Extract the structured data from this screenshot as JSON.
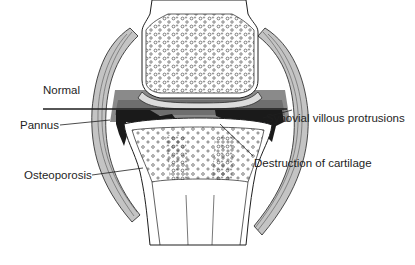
{
  "diagram": {
    "labels": {
      "normal": "Normal",
      "pannus": "Pannus",
      "synovial": "Synovial villous protrusions",
      "destruction": "Destruction of cartilage",
      "osteoporosis": "Osteoporosis"
    },
    "colors": {
      "line": "#1e1e1e",
      "capsule_fill": "#c8c8c8",
      "capsule_dark": "#8a8a8a",
      "synovium_fill": "#7a7a7a",
      "pannus_fill": "#1a1a1a",
      "bone_fill": "#ffffff"
    }
  }
}
